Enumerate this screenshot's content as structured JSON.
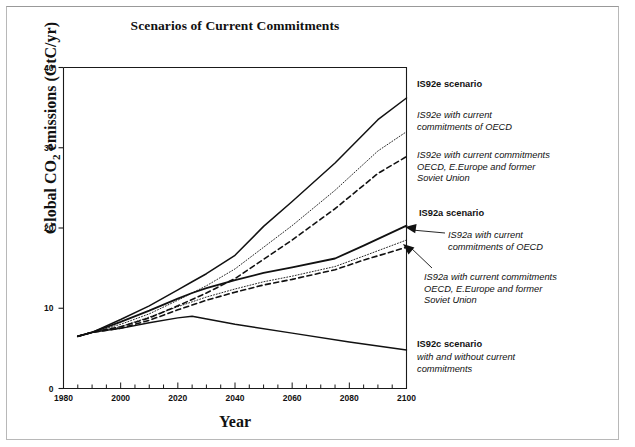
{
  "page": {
    "border_color": "#b8b8b8"
  },
  "chart_data": {
    "type": "line",
    "title": "Scenarios of Current Commitments",
    "xlabel": "Year",
    "ylabel": "Global CO2 emissions (GtC/yr)",
    "ylabel_parts": {
      "pre": "Global CO",
      "sub": "2",
      "post": " emissions (GtC/yr)"
    },
    "xlim": [
      1980,
      2100
    ],
    "ylim": [
      0,
      40
    ],
    "xticks": [
      1980,
      2000,
      2020,
      2040,
      2060,
      2080,
      2100
    ],
    "xticks_minor_step": 5,
    "yticks": [
      0,
      10,
      20,
      30,
      40
    ],
    "grid": false,
    "legend_position": "right-inline-annotations",
    "series": [
      {
        "name": "IS92e scenario",
        "style": "solid",
        "width": 1.5,
        "x": [
          1985,
          1990,
          2000,
          2010,
          2020,
          2025,
          2030,
          2040,
          2050,
          2060,
          2075,
          2090,
          2100
        ],
        "values": [
          6.5,
          7.0,
          8.6,
          10.3,
          12.3,
          13.3,
          14.3,
          16.6,
          20.2,
          23.3,
          28.1,
          33.5,
          36.2
        ]
      },
      {
        "name": "IS92e with current commitments of OECD",
        "style": "dotted",
        "width": 0.9,
        "x": [
          1985,
          1990,
          2000,
          2010,
          2020,
          2025,
          2030,
          2040,
          2050,
          2060,
          2075,
          2090,
          2100
        ],
        "values": [
          6.5,
          7.0,
          8.0,
          9.3,
          11.0,
          11.9,
          12.8,
          14.9,
          17.6,
          20.3,
          24.7,
          29.6,
          32.0
        ]
      },
      {
        "name": "IS92e with current commitments OECD, E.Europe and former Soviet Union",
        "style": "dashed",
        "width": 1.6,
        "x": [
          1985,
          1990,
          2000,
          2010,
          2020,
          2025,
          2030,
          2040,
          2050,
          2060,
          2075,
          2090,
          2100
        ],
        "values": [
          6.5,
          7.0,
          7.7,
          8.8,
          10.3,
          11.1,
          11.9,
          13.7,
          16.1,
          18.5,
          22.4,
          26.8,
          28.9
        ]
      },
      {
        "name": "IS92a scenario",
        "style": "solid",
        "width": 1.8,
        "x": [
          1985,
          1990,
          2000,
          2010,
          2020,
          2025,
          2030,
          2040,
          2050,
          2060,
          2075,
          2085,
          2100
        ],
        "values": [
          6.5,
          7.0,
          8.3,
          9.7,
          11.2,
          11.9,
          12.5,
          13.5,
          14.4,
          15.1,
          16.2,
          17.8,
          20.3
        ]
      },
      {
        "name": "IS92a with current commitments of OECD",
        "style": "dotted",
        "width": 0.9,
        "x": [
          1985,
          1990,
          2000,
          2010,
          2020,
          2025,
          2030,
          2040,
          2050,
          2060,
          2075,
          2085,
          2100
        ],
        "values": [
          6.5,
          7.0,
          7.7,
          8.9,
          10.2,
          10.8,
          11.4,
          12.4,
          13.3,
          14.0,
          15.2,
          16.5,
          18.5
        ]
      },
      {
        "name": "IS92a with current commitments OECD, E.Europe and former Soviet Union",
        "style": "dashed",
        "width": 1.6,
        "x": [
          1985,
          1990,
          2000,
          2010,
          2020,
          2025,
          2030,
          2040,
          2050,
          2060,
          2075,
          2085,
          2100
        ],
        "values": [
          6.5,
          7.0,
          7.5,
          8.5,
          9.8,
          10.4,
          11.0,
          12.0,
          12.9,
          13.6,
          14.8,
          16.0,
          17.6
        ]
      },
      {
        "name": "IS92c scenario with and without current commitments",
        "style": "solid",
        "width": 1.4,
        "x": [
          1985,
          1990,
          2000,
          2010,
          2020,
          2025,
          2040,
          2060,
          2080,
          2100
        ],
        "values": [
          6.5,
          7.0,
          7.5,
          8.2,
          8.8,
          9.0,
          8.0,
          6.9,
          5.8,
          4.8
        ]
      }
    ],
    "annotations": [
      {
        "id": "is92e-scenario",
        "text": "IS92e scenario",
        "style": "bold",
        "x": 417,
        "y": 79
      },
      {
        "id": "is92e-oecd",
        "text": "IS92e with current\ncommitments of OECD",
        "style": "italic",
        "x": 417,
        "y": 110
      },
      {
        "id": "is92e-oecd-eeurope",
        "text": "IS92e with current commitments\nOECD, E.Europe and former\nSoviet Union",
        "style": "italic",
        "x": 417,
        "y": 150
      },
      {
        "id": "is92a-scenario",
        "text": "IS92a scenario",
        "style": "bold",
        "x": 419,
        "y": 208
      },
      {
        "id": "is92a-oecd",
        "text": "IS92a with current\ncommitments of OECD",
        "style": "italic",
        "x": 448,
        "y": 230
      },
      {
        "id": "is92a-oecd-eeurope",
        "text": "IS92a with current commitments\nOECD, E.Europe and former\nSoviet Union",
        "style": "italic",
        "x": 424,
        "y": 272
      },
      {
        "id": "is92c-scenario",
        "text": "IS92c scenario",
        "style": "bold",
        "x": 417,
        "y": 339
      },
      {
        "id": "is92c-sub",
        "text": "with and without current\ncommitments",
        "style": "italic",
        "x": 417,
        "y": 352
      }
    ],
    "arrows": [
      {
        "id": "arrow-is92a-oecd",
        "from": [
          445,
          233
        ],
        "to": [
          405,
          227
        ]
      },
      {
        "id": "arrow-is92a-oecd-eeurope",
        "from": [
          432,
          268
        ],
        "to": [
          403,
          244
        ]
      }
    ]
  }
}
